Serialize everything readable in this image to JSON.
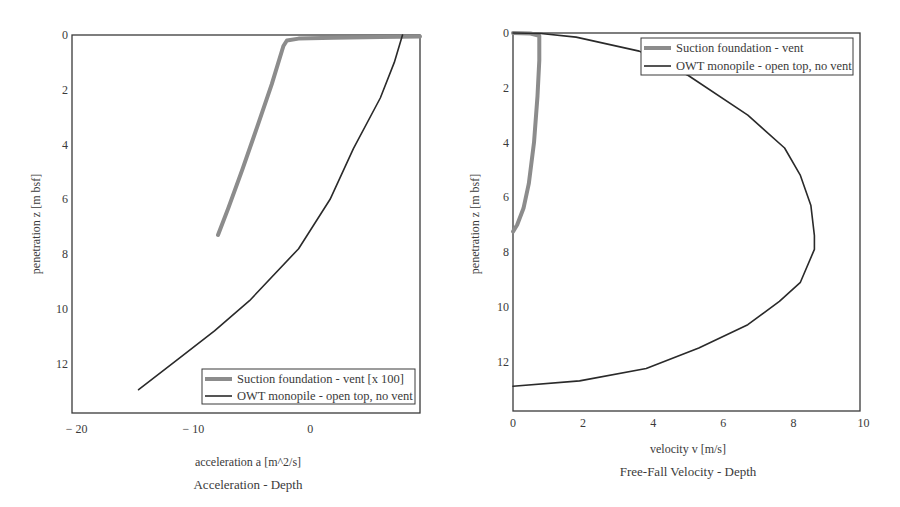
{
  "chart_data": [
    {
      "type": "line",
      "title": "Acceleration - Depth",
      "xlabel": "acceleration a [m^2/s]",
      "ylabel": "penetration z [m bsf]",
      "xlim": [
        -20.4,
        9.4
      ],
      "ylim": [
        13.8,
        0
      ],
      "y_inverted": true,
      "grid": false,
      "x_ticks": [
        -20,
        -10,
        0
      ],
      "x_tick_labels": [
        "− 20",
        "− 10",
        "0"
      ],
      "y_ticks": [
        0,
        2,
        4,
        6,
        8,
        10,
        12
      ],
      "legend_position": "lower right",
      "series": [
        {
          "name": "Suction foundation - vent [x 100]",
          "color": "#8c8c8c",
          "width": 4,
          "points": [
            [
              9.4,
              0.05
            ],
            [
              6.0,
              0.07
            ],
            [
              2.0,
              0.1
            ],
            [
              -1.0,
              0.13
            ],
            [
              -2.0,
              0.2
            ],
            [
              -2.3,
              0.4
            ],
            [
              -3.3,
              1.8
            ],
            [
              -4.5,
              3.3
            ],
            [
              -5.8,
              4.9
            ],
            [
              -7.0,
              6.3
            ],
            [
              -7.9,
              7.3
            ]
          ]
        },
        {
          "name": "OWT monopile - open top, no vent",
          "color": "#2a2a2a",
          "width": 1.6,
          "points": [
            [
              7.9,
              0.0
            ],
            [
              7.2,
              1.0
            ],
            [
              6.0,
              2.3
            ],
            [
              3.7,
              4.15
            ],
            [
              1.7,
              6.0
            ],
            [
              -1.0,
              7.8
            ],
            [
              -5.2,
              9.7
            ],
            [
              -8.2,
              10.8
            ],
            [
              -11.2,
              11.8
            ],
            [
              -14.7,
              12.95
            ]
          ]
        }
      ]
    },
    {
      "type": "line",
      "title": "Free-Fall Velocity - Depth",
      "xlabel": "velocity v [m/s]",
      "ylabel": "penetration z [m bsf]",
      "xlim": [
        0,
        9.9
      ],
      "ylim": [
        13.8,
        0
      ],
      "y_inverted": true,
      "grid": false,
      "x_ticks": [
        0,
        2,
        4,
        6,
        8,
        10
      ],
      "x_tick_labels": [
        "0",
        "2",
        "4",
        "6",
        "8",
        "10"
      ],
      "y_ticks": [
        0,
        2,
        4,
        6,
        8,
        10,
        12
      ],
      "legend_position": "upper right",
      "series": [
        {
          "name": "Suction foundation - vent",
          "color": "#8c8c8c",
          "width": 4,
          "points": [
            [
              0.0,
              0.0
            ],
            [
              0.5,
              0.02
            ],
            [
              0.75,
              0.1
            ],
            [
              0.75,
              1.0
            ],
            [
              0.7,
              2.3
            ],
            [
              0.6,
              4.0
            ],
            [
              0.45,
              5.5
            ],
            [
              0.3,
              6.4
            ],
            [
              0.12,
              7.0
            ],
            [
              0.0,
              7.25
            ]
          ]
        },
        {
          "name": "OWT monopile - open top, no vent",
          "color": "#2a2a2a",
          "width": 1.6,
          "points": [
            [
              0.0,
              0.0
            ],
            [
              0.8,
              0.02
            ],
            [
              1.8,
              0.15
            ],
            [
              3.6,
              0.66
            ],
            [
              5.0,
              1.55
            ],
            [
              6.7,
              3.0
            ],
            [
              7.75,
              4.2
            ],
            [
              8.2,
              5.2
            ],
            [
              8.5,
              6.3
            ],
            [
              8.6,
              7.4
            ],
            [
              8.6,
              7.9
            ],
            [
              8.2,
              9.1
            ],
            [
              7.6,
              9.8
            ],
            [
              6.7,
              10.65
            ],
            [
              5.3,
              11.5
            ],
            [
              3.8,
              12.25
            ],
            [
              1.9,
              12.7
            ],
            [
              0.0,
              12.9
            ]
          ]
        }
      ]
    }
  ],
  "charts": [
    {
      "title": "Acceleration - Depth",
      "xlabel": "acceleration a [m^2/s]",
      "ylabel": "penetration z [m bsf]",
      "legend": [
        "Suction foundation - vent [x 100]",
        "OWT monopile - open top, no vent"
      ]
    },
    {
      "title": "Free-Fall Velocity - Depth",
      "xlabel": "velocity v [m/s]",
      "ylabel": "penetration z [m bsf]",
      "legend": [
        "Suction foundation - vent",
        "OWT monopile - open top, no vent"
      ]
    }
  ]
}
